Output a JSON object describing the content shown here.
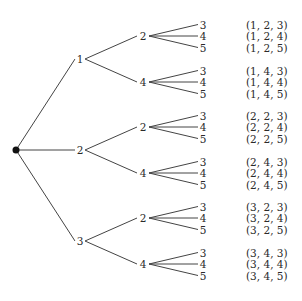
{
  "diagram": {
    "type": "tree",
    "root": {
      "label": ""
    },
    "level1": [
      "1",
      "2",
      "3"
    ],
    "level2": [
      "2",
      "4"
    ],
    "level3": [
      "3",
      "4",
      "5"
    ],
    "outcomes": [
      "(1, 2, 3)",
      "(1, 2, 4)",
      "(1, 2, 5)",
      "(1, 4, 3)",
      "(1, 4, 4)",
      "(1, 4, 5)",
      "(2, 2, 3)",
      "(2, 2, 4)",
      "(2, 2, 5)",
      "(2, 4, 3)",
      "(2, 4, 4)",
      "(2, 4, 5)",
      "(3, 2, 3)",
      "(3, 2, 4)",
      "(3, 2, 5)",
      "(3, 4, 3)",
      "(3, 4, 4)",
      "(3, 4, 5)"
    ]
  },
  "colors": {
    "line": "#444444",
    "text": "#2a2a2a",
    "node": "#111111",
    "background": "#ffffff"
  }
}
